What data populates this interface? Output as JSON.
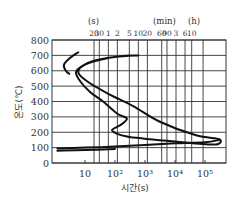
{
  "chart_data": {
    "type": "line",
    "title": "",
    "xlabel": "시간(s)",
    "ylabel": "온도(℃)",
    "xscale": "log",
    "xlim": [
      1,
      500000
    ],
    "ylim": [
      0,
      800
    ],
    "grid": true,
    "y_ticks": [
      0,
      100,
      200,
      300,
      400,
      500,
      600,
      700,
      800
    ],
    "x_ticks_bottom": [
      {
        "value": 10,
        "label": "10"
      },
      {
        "value": 100,
        "label": "10²"
      },
      {
        "value": 1000,
        "label": "10³"
      },
      {
        "value": 10000,
        "label": "10⁴"
      },
      {
        "value": 100000,
        "label": "10⁵"
      }
    ],
    "x_ticks_top_units": [
      {
        "label": "(s)",
        "value": 25
      },
      {
        "label": "(min)",
        "value": 3000
      },
      {
        "label": "(h)",
        "value": 36000
      }
    ],
    "x_ticks_top": [
      {
        "value": 20,
        "label": "20"
      },
      {
        "value": 30,
        "label": "30"
      },
      {
        "value": 60,
        "label": "1"
      },
      {
        "value": 120,
        "label": "2"
      },
      {
        "value": 300,
        "label": "5"
      },
      {
        "value": 600,
        "label": "10"
      },
      {
        "value": 1200,
        "label": "20"
      },
      {
        "value": 3600,
        "label": "60"
      },
      {
        "value": 5400,
        "label": "90"
      },
      {
        "value": 10800,
        "label": "3"
      },
      {
        "value": 21600,
        "label": "6"
      },
      {
        "value": 36000,
        "label": "10"
      },
      {
        "value": 86400,
        "label": ""
      }
    ],
    "series": [
      {
        "name": "curve-1 (start of transformation, small C-curve)",
        "points": [
          [
            6,
            720
          ],
          [
            3.5,
            690
          ],
          [
            2,
            640
          ],
          [
            2.3,
            600
          ],
          [
            3,
            580
          ]
        ]
      },
      {
        "name": "curve-2 (transformation start)",
        "points": [
          [
            600,
            700
          ],
          [
            100,
            690
          ],
          [
            20,
            665
          ],
          [
            8,
            630
          ],
          [
            5,
            590
          ],
          [
            7,
            530
          ],
          [
            15,
            460
          ],
          [
            40,
            400
          ],
          [
            120,
            320
          ],
          [
            250,
            290
          ],
          [
            160,
            250
          ],
          [
            80,
            215
          ],
          [
            120,
            190
          ],
          [
            300,
            170
          ],
          [
            10000,
            140
          ],
          [
            200000,
            120
          ],
          [
            300000,
            155
          ],
          [
            50000,
            180
          ],
          [
            3000,
            270
          ],
          [
            400,
            370
          ],
          [
            60,
            450
          ],
          [
            12,
            530
          ],
          [
            6,
            590
          ],
          [
            10,
            640
          ],
          [
            50,
            680
          ],
          [
            300,
            700
          ]
        ]
      },
      {
        "name": "curve-3 (martensite / bottom line)",
        "points": [
          [
            1.2,
            95
          ],
          [
            10,
            100
          ],
          [
            100,
            108
          ],
          [
            1000,
            118
          ],
          [
            10000,
            128
          ],
          [
            100000,
            135
          ],
          [
            300000,
            150
          ]
        ]
      },
      {
        "name": "curve-4 (Ms reference)",
        "points": [
          [
            1.2,
            80
          ],
          [
            10,
            84
          ],
          [
            100,
            92
          ]
        ]
      }
    ]
  },
  "labels": {
    "ylabel": "온도(℃)",
    "xlabel": "시간(s)",
    "unit_s": "(s)",
    "unit_min": "(min)",
    "unit_h": "(h)"
  }
}
